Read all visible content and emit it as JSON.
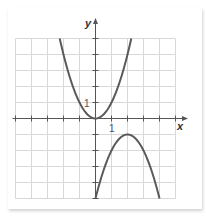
{
  "chart_data": {
    "type": "line",
    "title": "",
    "xlabel": "x",
    "ylabel": "y",
    "xlim": [
      -5,
      5
    ],
    "ylim": [
      -5,
      5
    ],
    "grid": true,
    "tick_labels": {
      "x": [
        "1"
      ],
      "y": [
        "1"
      ]
    },
    "series": [
      {
        "name": "upper parabola",
        "equation": "y = x^2",
        "vertex": [
          0,
          0
        ],
        "x": [
          -2.24,
          -2,
          -1,
          0,
          1,
          2,
          2.24
        ],
        "y": [
          5,
          4,
          1,
          0,
          1,
          4,
          5
        ]
      },
      {
        "name": "lower parabola",
        "equation": "y = -(x-2)^2 - 1",
        "vertex": [
          2,
          -1
        ],
        "x": [
          0,
          1,
          2,
          3,
          4
        ],
        "y": [
          -5,
          -2,
          -1,
          -2,
          -5
        ]
      }
    ]
  },
  "labels": {
    "x_axis": "x",
    "y_axis": "y",
    "x_tick": "1",
    "y_tick": "1"
  },
  "colors": {
    "curve": "#5a5a5a",
    "grid": "#d8d8d8",
    "axis": "#555555"
  }
}
